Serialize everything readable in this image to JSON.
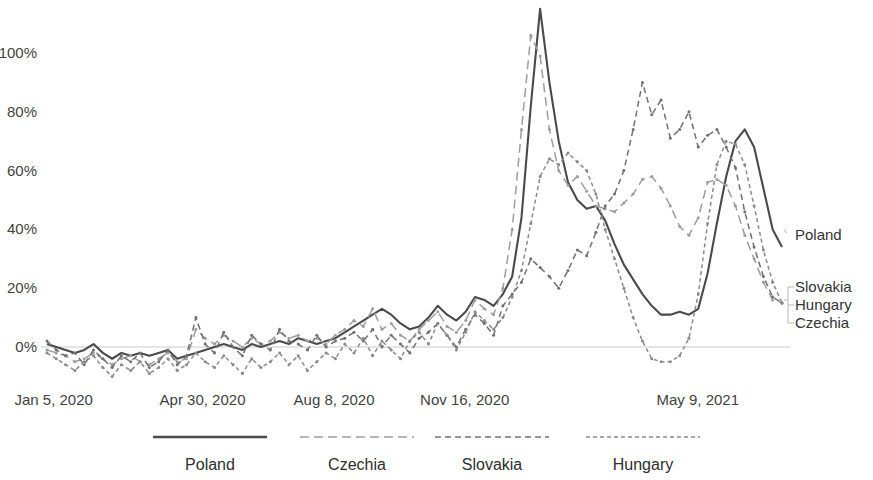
{
  "chart_data": {
    "type": "line",
    "title": "",
    "subtitle": "",
    "xlabel": "",
    "ylabel": "",
    "ylim": [
      -12,
      120
    ],
    "ytick_values": [
      0,
      20,
      40,
      60,
      80,
      100
    ],
    "ytick_labels": [
      "0%",
      "20%",
      "40%",
      "60%",
      "80%",
      "100%"
    ],
    "grid": false,
    "zero_line": true,
    "legend_position": "bottom",
    "x_axis_type": "weekly-dates",
    "x_count": 80,
    "xtick_indices": [
      1,
      17,
      31,
      45,
      70
    ],
    "xtick_labels": [
      "Jan 5, 2020",
      "Apr 30, 2020",
      "Aug 8, 2020",
      "Nov 16, 2020",
      "May 9, 2021"
    ],
    "series": [
      {
        "name": "Poland",
        "color": "#4a4a4a",
        "style": "solid",
        "stroke_width": 2.1,
        "dasharray": "",
        "markers": false,
        "end_label": "Poland",
        "values": [
          1,
          0,
          -1,
          -2,
          -1,
          1,
          -2,
          -4,
          -2,
          -3,
          -2,
          -3,
          -2,
          -1,
          -4,
          -3,
          -2,
          -1,
          0,
          1,
          0,
          -1,
          1,
          0,
          1,
          2,
          1,
          3,
          2,
          1,
          2,
          3,
          5,
          7,
          9,
          11,
          13,
          11,
          8,
          6,
          7,
          10,
          14,
          11,
          9,
          12,
          17,
          16,
          14,
          18,
          24,
          44,
          82,
          115,
          90,
          70,
          56,
          50,
          47,
          48,
          43,
          35,
          28,
          23,
          18,
          14,
          11,
          11,
          12,
          11,
          13,
          25,
          42,
          58,
          70,
          74,
          68,
          54,
          40,
          34
        ]
      },
      {
        "name": "Czechia",
        "color": "#9d9d9d",
        "style": "long-dash",
        "stroke_width": 1.5,
        "dasharray": "9 5",
        "markers": true,
        "end_label": "Czechia",
        "values": [
          -1,
          -2,
          -3,
          -5,
          -4,
          -2,
          -4,
          -6,
          -4,
          -3,
          -5,
          -6,
          -4,
          -2,
          -5,
          -4,
          6,
          3,
          1,
          4,
          2,
          0,
          3,
          1,
          2,
          5,
          3,
          4,
          2,
          3,
          1,
          4,
          6,
          9,
          7,
          13,
          6,
          8,
          4,
          2,
          6,
          9,
          12,
          7,
          5,
          9,
          16,
          13,
          11,
          20,
          40,
          74,
          106,
          99,
          74,
          60,
          55,
          58,
          53,
          48,
          47,
          46,
          49,
          52,
          57,
          58,
          54,
          48,
          41,
          38,
          44,
          56,
          57,
          55,
          48,
          38,
          30,
          22,
          16,
          15
        ]
      },
      {
        "name": "Slovakia",
        "color": "#707070",
        "style": "medium-dash",
        "stroke_width": 1.5,
        "dasharray": "6 4",
        "markers": true,
        "end_label": "Slovakia",
        "values": [
          2,
          -1,
          -3,
          -2,
          -6,
          -1,
          -4,
          -7,
          -3,
          -5,
          -2,
          -7,
          -5,
          -1,
          -6,
          -3,
          10,
          1,
          -2,
          5,
          0,
          -3,
          4,
          1,
          -1,
          6,
          2,
          1,
          -1,
          4,
          0,
          2,
          3,
          5,
          2,
          6,
          0,
          4,
          1,
          -2,
          3,
          5,
          8,
          4,
          0,
          6,
          11,
          8,
          4,
          14,
          18,
          22,
          30,
          27,
          24,
          20,
          26,
          33,
          31,
          39,
          48,
          52,
          60,
          74,
          90,
          79,
          84,
          71,
          74,
          80,
          68,
          72,
          74,
          68,
          61,
          46,
          34,
          24,
          17,
          15
        ]
      },
      {
        "name": "Hungary",
        "color": "#8a8a8a",
        "style": "short-dash",
        "stroke_width": 1.5,
        "dasharray": "4 3",
        "markers": true,
        "end_label": "Hungary",
        "values": [
          -2,
          -4,
          -6,
          -8,
          -5,
          -3,
          -7,
          -10,
          -6,
          -8,
          -5,
          -9,
          -7,
          -4,
          -8,
          -6,
          -2,
          -5,
          -7,
          -3,
          -6,
          -9,
          -4,
          -7,
          -5,
          -2,
          -6,
          -3,
          -8,
          -5,
          -2,
          -4,
          1,
          -2,
          3,
          -3,
          2,
          -1,
          -4,
          2,
          5,
          1,
          8,
          4,
          -1,
          5,
          12,
          9,
          6,
          10,
          17,
          26,
          42,
          58,
          64,
          62,
          66,
          63,
          60,
          52,
          40,
          30,
          20,
          10,
          2,
          -4,
          -5,
          -5,
          -3,
          3,
          18,
          42,
          62,
          70,
          69,
          62,
          48,
          33,
          22,
          15
        ]
      }
    ],
    "legend_items": [
      {
        "label": "Poland",
        "style": "solid",
        "color": "#4a4a4a",
        "dasharray": "",
        "stroke_width": 2.4
      },
      {
        "label": "Czechia",
        "style": "long-dash",
        "color": "#9d9d9d",
        "dasharray": "9 5",
        "stroke_width": 1.6
      },
      {
        "label": "Slovakia",
        "style": "medium-dash",
        "color": "#707070",
        "dasharray": "6 4",
        "stroke_width": 1.6
      },
      {
        "label": "Hungary",
        "style": "short-dash",
        "color": "#8a8a8a",
        "dasharray": "4 3",
        "stroke_width": 1.6
      }
    ],
    "end_labels": [
      {
        "label": "Poland",
        "y_pct": 40
      },
      {
        "label": "Slovakia",
        "y_pct": 22
      },
      {
        "label": "Hungary",
        "y_pct": 16
      },
      {
        "label": "Czechia",
        "y_pct": 11
      }
    ]
  }
}
